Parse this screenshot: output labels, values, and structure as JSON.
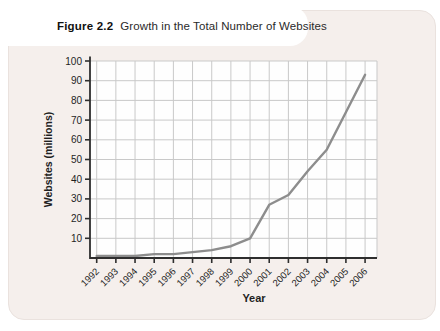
{
  "figure": {
    "label": "Figure 2.2",
    "title": "Growth in the Total Number of Websites"
  },
  "chart_data": {
    "type": "line",
    "categories": [
      "1992",
      "1993",
      "1994",
      "1995",
      "1996",
      "1997",
      "1998",
      "1999",
      "2000",
      "2001",
      "2002",
      "2003",
      "2004",
      "2005",
      "2006"
    ],
    "series": [
      {
        "name": "Total websites",
        "values": [
          1,
          1,
          1,
          2,
          2,
          3,
          4,
          6,
          10,
          27,
          32,
          44,
          55,
          74,
          93
        ]
      }
    ],
    "title": "Growth in the Total Number of Websites",
    "xlabel": "Year",
    "ylabel": "Websites (millions)",
    "ylim": [
      0,
      100
    ],
    "yticks": [
      10,
      20,
      30,
      40,
      50,
      60,
      70,
      80,
      90,
      100
    ],
    "grid": true,
    "legend": "none",
    "line_color": "#8d8d8d"
  },
  "colors": {
    "card_background": "#f5efec",
    "plot_background": "#fefefe",
    "gridline": "#c9c9c9",
    "axis": "#2e2e2e",
    "tick_text": "#1f1f1f",
    "data_line": "#8d8d8d"
  }
}
